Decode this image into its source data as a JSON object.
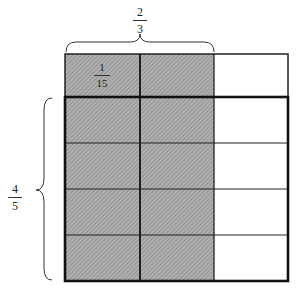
{
  "diagram": {
    "type": "area-model-fraction-multiplication",
    "columns": 3,
    "rows": 5,
    "shaded_columns": 2,
    "highlighted_rows": 4,
    "cell_label": {
      "numerator": "1",
      "denominator": "15"
    },
    "top_brace_label": {
      "numerator": "2",
      "denominator": "3"
    },
    "left_brace_label": {
      "numerator": "4",
      "denominator": "5"
    },
    "colors": {
      "shade": "#a8a8a8",
      "hatch": "#7a7a7a",
      "line": "#1a1a1a",
      "background": "#ffffff"
    }
  }
}
